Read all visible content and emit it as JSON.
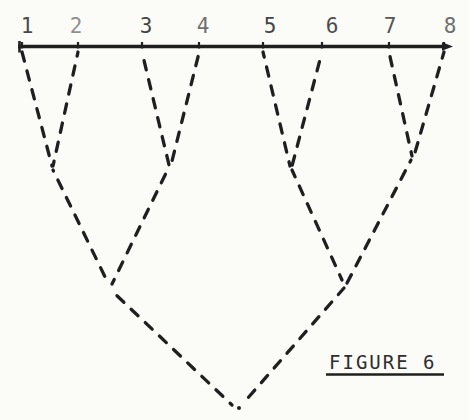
{
  "figure": {
    "caption": "FIGURE 6",
    "ink_color": "#1f1f1f",
    "label_color": "#3a3a3a",
    "caption_color": "#2e2e2e",
    "paper_color": "#fbfbf8"
  },
  "diagram": {
    "type": "nested-dashed-vee-tree",
    "baseline": {
      "y": 46.5,
      "x_start": 18,
      "x_end": 445,
      "arrow_tip_x": 453,
      "stroke_width": 3.4
    },
    "leaf_labels": [
      {
        "label": "1",
        "label_x": 27,
        "attach_x": 22,
        "opacity": 0.92
      },
      {
        "label": "2",
        "label_x": 76,
        "attach_x": 78,
        "opacity": 0.55
      },
      {
        "label": "3",
        "label_x": 146,
        "attach_x": 142,
        "opacity": 0.95
      },
      {
        "label": "4",
        "label_x": 203,
        "attach_x": 199,
        "opacity": 0.72
      },
      {
        "label": "5",
        "label_x": 270,
        "attach_x": 263,
        "opacity": 0.95
      },
      {
        "label": "6",
        "label_x": 332,
        "attach_x": 322,
        "opacity": 0.9
      },
      {
        "label": "7",
        "label_x": 390,
        "attach_x": 389,
        "opacity": 0.85
      },
      {
        "label": "8",
        "label_x": 450,
        "attach_x": 444,
        "opacity": 0.72
      }
    ],
    "label_baseline_y": 33,
    "label_font_size": 21,
    "merge_points": {
      "m12": [
        52,
        166
      ],
      "m34": [
        170,
        165
      ],
      "m56": [
        291,
        166
      ],
      "m78": [
        413,
        156
      ],
      "m1234": [
        110,
        287
      ],
      "m5678": [
        344,
        283
      ],
      "root": [
        237,
        407
      ]
    },
    "segments": [
      {
        "name": "leaf1-to-m12",
        "x1": 22,
        "y1": 52,
        "x2": 52,
        "y2": 166
      },
      {
        "name": "leaf2-to-m12",
        "x1": 78,
        "y1": 52,
        "x2": 53,
        "y2": 166
      },
      {
        "name": "leaf3-to-m34",
        "x1": 142,
        "y1": 52,
        "x2": 169,
        "y2": 165
      },
      {
        "name": "leaf4-to-m34",
        "x1": 199,
        "y1": 53,
        "x2": 171,
        "y2": 165
      },
      {
        "name": "leaf5-to-m56",
        "x1": 263,
        "y1": 52,
        "x2": 290,
        "y2": 166
      },
      {
        "name": "leaf6-to-m56",
        "x1": 322,
        "y1": 52,
        "x2": 292,
        "y2": 166
      },
      {
        "name": "leaf7-to-m78",
        "x1": 389,
        "y1": 52,
        "x2": 412,
        "y2": 156
      },
      {
        "name": "leaf8-to-m78",
        "x1": 444,
        "y1": 52,
        "x2": 414,
        "y2": 156
      },
      {
        "name": "m12-to-m1234",
        "x1": 53,
        "y1": 170,
        "x2": 109,
        "y2": 285
      },
      {
        "name": "m34-to-m1234",
        "x1": 168,
        "y1": 169,
        "x2": 112,
        "y2": 284
      },
      {
        "name": "m56-to-m5678",
        "x1": 292,
        "y1": 170,
        "x2": 342,
        "y2": 280
      },
      {
        "name": "m78-to-m5678",
        "x1": 411,
        "y1": 160,
        "x2": 346,
        "y2": 285
      },
      {
        "name": "m1234-to-root",
        "x1": 112,
        "y1": 291,
        "x2": 232,
        "y2": 405
      },
      {
        "name": "m5678-to-root",
        "x1": 344,
        "y1": 288,
        "x2": 247,
        "y2": 399
      }
    ],
    "apex_dot": {
      "x": 239,
      "y": 408,
      "r": 2
    },
    "dash": {
      "array": "9.5 10",
      "width": 3.3,
      "cap": "round"
    }
  },
  "caption": {
    "x": 329,
    "y": 369,
    "font_size": 19,
    "letter_spacing": 2,
    "underline_x1": 326,
    "underline_x2": 444,
    "underline_y": 374.5,
    "underline_width": 2.6
  }
}
